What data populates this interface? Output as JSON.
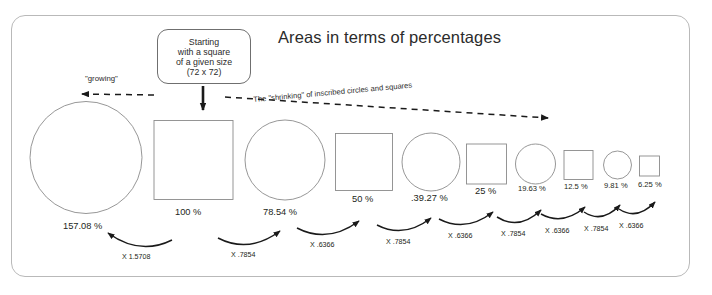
{
  "diagram": {
    "title": "Areas in terms of percentages",
    "callout": {
      "line1": "Starting",
      "line2": "with a square",
      "line3": "of a given size",
      "line4": "(72 x 72)"
    },
    "left_arrow_label": "\"growing\"",
    "right_arrow_label": "The \"shrinking\" of inscribed circles and squares",
    "frame_color": "#b9b9b9",
    "ink_color": "#231f20",
    "shape_stroke": "#8b8b8b"
  },
  "shapes": [
    {
      "kind": "circle",
      "percent": "157.08 %",
      "cx": 86,
      "cy": 157.5,
      "size": 112
    },
    {
      "kind": "square",
      "percent": "100 %",
      "cx": 193.5,
      "cy": 160,
      "size": 79
    },
    {
      "kind": "circle",
      "percent": "78.54 %",
      "cx": 285,
      "cy": 160,
      "size": 80
    },
    {
      "kind": "square",
      "percent": "50 %",
      "cx": 364,
      "cy": 162,
      "size": 57
    },
    {
      "kind": "circle",
      "percent": ".39.27 %",
      "cx": 431,
      "cy": 162,
      "size": 58
    },
    {
      "kind": "square",
      "percent": "25 %",
      "cx": 486.5,
      "cy": 164,
      "size": 40
    },
    {
      "kind": "circle",
      "percent": "19.63 %",
      "cx": 535.5,
      "cy": 164,
      "size": 40
    },
    {
      "kind": "square",
      "percent": "12.5 %",
      "cx": 578.5,
      "cy": 165,
      "size": 29
    },
    {
      "kind": "circle",
      "percent": "9.81 %",
      "cx": 617.5,
      "cy": 165,
      "size": 28
    },
    {
      "kind": "square",
      "percent": "6.25 %",
      "cx": 649.5,
      "cy": 166,
      "size": 20
    }
  ],
  "multipliers": [
    {
      "label": "X 1.5708",
      "direction": "left"
    },
    {
      "label": "X .7854",
      "direction": "right"
    },
    {
      "label": "X .6366",
      "direction": "right"
    },
    {
      "label": "X .7854",
      "direction": "right"
    },
    {
      "label": "X .6366",
      "direction": "right"
    },
    {
      "label": "X .7854",
      "direction": "right"
    },
    {
      "label": "X .6366",
      "direction": "right"
    },
    {
      "label": "X .7854",
      "direction": "right"
    },
    {
      "label": "X .6366",
      "direction": "right"
    }
  ],
  "percent_label_positions": [
    {
      "x": 63,
      "y": 221
    },
    {
      "x": 175,
      "y": 207
    },
    {
      "x": 263,
      "y": 207
    },
    {
      "x": 352,
      "y": 194
    },
    {
      "x": 411,
      "y": 193
    },
    {
      "x": 475,
      "y": 186
    },
    {
      "x": 518,
      "y": 184
    },
    {
      "x": 564,
      "y": 182
    },
    {
      "x": 604,
      "y": 181
    },
    {
      "x": 638,
      "y": 180
    }
  ],
  "multiplier_label_positions": [
    {
      "x": 122,
      "y": 253
    },
    {
      "x": 231,
      "y": 251
    },
    {
      "x": 310,
      "y": 241
    },
    {
      "x": 386,
      "y": 238
    },
    {
      "x": 448,
      "y": 232
    },
    {
      "x": 501,
      "y": 230
    },
    {
      "x": 545,
      "y": 227
    },
    {
      "x": 584,
      "y": 225
    },
    {
      "x": 619,
      "y": 222
    }
  ]
}
